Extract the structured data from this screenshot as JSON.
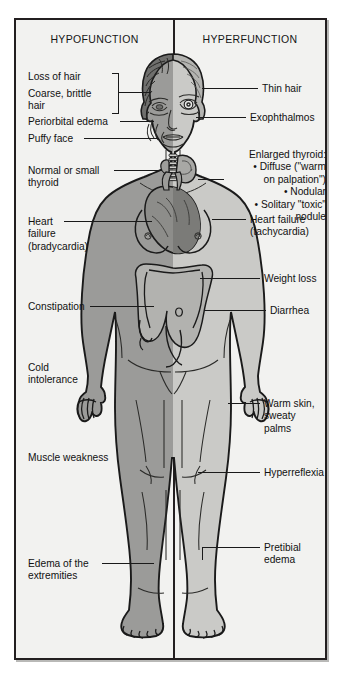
{
  "figure": {
    "columns": {
      "left_header": "HYPOFUNCTION",
      "right_header": "HYPERFUNCTION"
    },
    "background_color": "#f2f2f0",
    "border_color": "#231f20",
    "body_fill_hypo": "#9a9a98",
    "body_fill_hyper": "#c9c9c6",
    "organ_fill": "#b0b0ad",
    "heart_fill": "#8a8a88"
  },
  "labels_left": [
    {
      "id": "loss-of-hair",
      "text": "Loss of hair"
    },
    {
      "id": "coarse-brittle-hair",
      "text": "Coarse, brittle\nhair"
    },
    {
      "id": "periorbital-edema",
      "text": "Periorbital edema"
    },
    {
      "id": "puffy-face",
      "text": "Puffy face"
    },
    {
      "id": "normal-or-small-thyroid",
      "text": "Normal or small\nthyroid"
    },
    {
      "id": "heart-failure-bradycardia",
      "text": "Heart\nfailure\n(bradycardia)"
    },
    {
      "id": "constipation",
      "text": "Constipation"
    },
    {
      "id": "cold-intolerance",
      "text": "Cold\nintolerance"
    },
    {
      "id": "muscle-weakness",
      "text": "Muscle weakness"
    },
    {
      "id": "edema-of-the-extremities",
      "text": "Edema of the\nextremities"
    }
  ],
  "labels_right": [
    {
      "id": "thin-hair",
      "text": "Thin hair"
    },
    {
      "id": "exophthalmos",
      "text": "Exophthalmos"
    },
    {
      "id": "enlarged-thyroid",
      "text": "Enlarged thyroid:\n• Diffuse (\"warm\non palpation\")\n• Nodular\n• Solitary \"toxic\"\nnodule"
    },
    {
      "id": "heart-failure-tachycardia",
      "text": "Heart failure\n(tachycardia)"
    },
    {
      "id": "weight-loss",
      "text": "Weight loss"
    },
    {
      "id": "diarrhea",
      "text": "Diarrhea"
    },
    {
      "id": "warm-skin-sweaty-palms",
      "text": "Warm skin,\nsweaty palms"
    },
    {
      "id": "hyperreflexia",
      "text": "Hyperreflexia"
    },
    {
      "id": "pretibial-edema",
      "text": "Pretibial\nedema"
    }
  ],
  "illustration": {
    "subject": "anterior-female-figure",
    "hypo_side": "left",
    "hyper_side": "right",
    "organs_shown": [
      "thyroid-gland",
      "trachea",
      "heart",
      "large-intestine"
    ]
  }
}
